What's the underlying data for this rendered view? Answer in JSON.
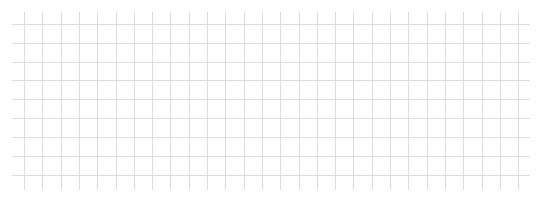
{
  "canvas": {
    "width": 541,
    "height": 197,
    "background": "#ffffff"
  },
  "grid": {
    "line_color": "#dcdcdc",
    "line_width": 1,
    "horizontal_lines": {
      "count": 9,
      "y_positions": [
        24,
        43,
        62,
        80,
        99,
        118,
        137,
        156,
        175
      ],
      "x_start": 12,
      "x_end": 530
    },
    "vertical_lines": {
      "count": 28,
      "x_positions": [
        24,
        42,
        61,
        79,
        97,
        116,
        134,
        152,
        170,
        189,
        207,
        225,
        244,
        262,
        280,
        299,
        317,
        335,
        353,
        372,
        390,
        408,
        427,
        445,
        463,
        482,
        500,
        518
      ],
      "y_start": 12,
      "y_end": 190
    }
  }
}
